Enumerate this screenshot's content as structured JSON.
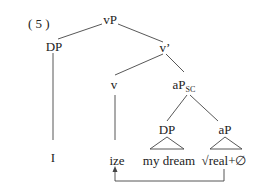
{
  "example_number": "( 5 )",
  "nodes": {
    "vP": "vP",
    "DP_spec": "DP",
    "v_bar": "v’",
    "v": "v",
    "aPsc": "aP",
    "aPsc_sub": "SC",
    "DP_inner": "DP",
    "aP_inner": "aP"
  },
  "leaves": {
    "I": "I",
    "ize": "ize",
    "my_dream": "my dream",
    "real": "√real+∅"
  },
  "movement_arrow": {
    "from": "√real+∅",
    "to": "ize"
  }
}
